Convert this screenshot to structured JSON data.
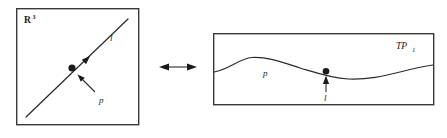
{
  "figure": {
    "width": 447,
    "height": 138,
    "background": "#ffffff",
    "ink_color": "#1a1a1a",
    "line_color": "#2b2b2b",
    "box_border_color": "#3a3a3a"
  },
  "left_panel": {
    "name": "euclidean-space-panel",
    "box": {
      "x": 16,
      "y": 8,
      "width": 123,
      "height": 117
    },
    "space_label": {
      "base": "R",
      "superscript": "3",
      "x": 24,
      "y": 22
    },
    "line": {
      "label": "l",
      "label_x": 110,
      "label_y": 40,
      "x1": 26,
      "y1": 117,
      "x2": 128,
      "y2": 19
    },
    "direction_arrow": {
      "x": 88,
      "y": 58,
      "angle_deg": -44
    },
    "point": {
      "label": "p",
      "label_x": 100,
      "label_y": 101,
      "dot_x": 72,
      "dot_y": 68,
      "dot_r": 3.4,
      "pointer_from_x": 95,
      "pointer_from_y": 92,
      "pointer_to_x": 78,
      "pointer_to_y": 75
    }
  },
  "connector": {
    "name": "duality-double-arrow",
    "glyph": "double-headed-arrow",
    "x1": 160,
    "x2": 196,
    "y": 67
  },
  "right_panel": {
    "name": "tangent-plane-panel",
    "box": {
      "x": 213,
      "y": 33,
      "width": 221,
      "height": 72
    },
    "plane_label": {
      "base": "TP",
      "subscript": "1",
      "x": 396,
      "y": 48
    },
    "curve": {
      "label": "p",
      "label_x": 264,
      "label_y": 74,
      "path": "M 213 72 C 232 68 240 58 252 57 C 268 56 282 62 300 68 C 314 72 330 78 348 79 C 368 80 384 76 400 72 C 415 68 426 66 434 65"
    },
    "incidence": {
      "label": "l",
      "label_x": 323,
      "label_y": 99,
      "dot_x": 326,
      "dot_y": 71,
      "dot_r": 3.2,
      "arrow_from_x": 326,
      "arrow_from_y": 93,
      "arrow_to_x": 326,
      "arrow_to_y": 76
    }
  }
}
